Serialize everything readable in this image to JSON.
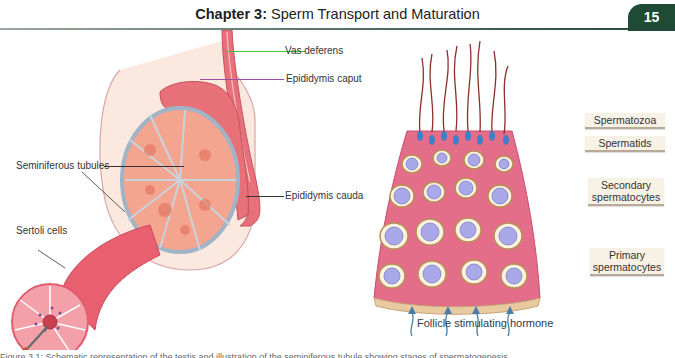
{
  "header": {
    "chapter_label": "Chapter 3:",
    "chapter_title": "Sperm Transport and Maturation",
    "page_number": "15"
  },
  "figure_left": {
    "labels": {
      "vas_deferens": "Vas deferens",
      "epididymis_caput": "Epididymis caput",
      "seminiferous_tubules": "Seminiferous tubules",
      "epididymis_cauda": "Epididymis cauda",
      "sertoli_cells": "Sertoli cells"
    },
    "colors": {
      "vas_deferens_leader": "#3cc43c",
      "epididymis_caput_leader": "#9b4fa6",
      "default_leader": "#333333"
    }
  },
  "figure_right": {
    "stages": [
      {
        "label": "Spermatozoa"
      },
      {
        "label": "Spermatids"
      },
      {
        "label": "Secondary spermatocytes"
      },
      {
        "label": "Primary spermatocytes"
      }
    ],
    "hormone_label": "Follicle stimulating hormone"
  },
  "caption": {
    "text": "Figure 3.1: Schematic representation of the testis and illustration of the seminiferous tubule showing stages of spermatogenesis"
  }
}
